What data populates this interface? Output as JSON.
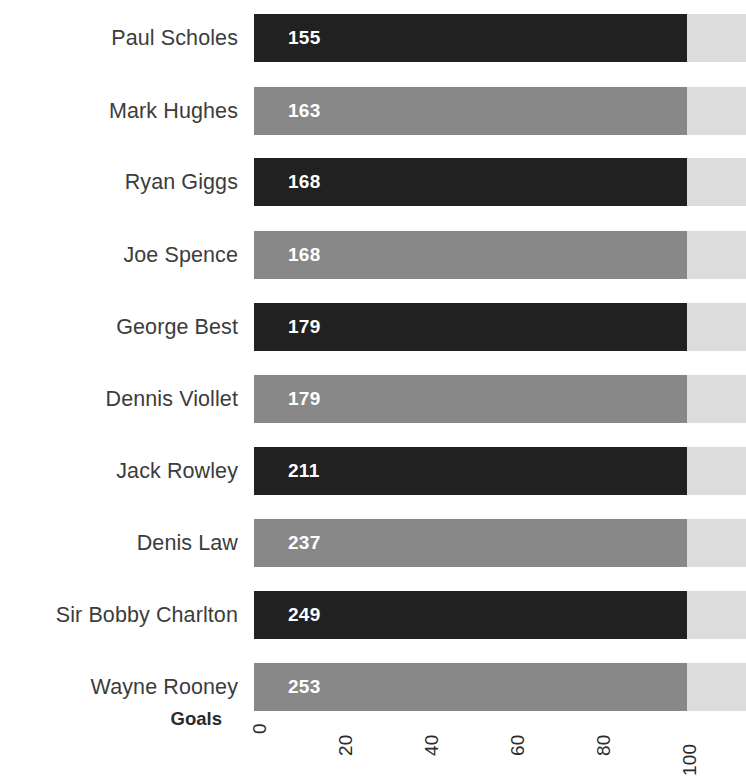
{
  "chart_data": {
    "type": "bar",
    "orientation": "horizontal",
    "title": "",
    "xlabel": "Goals",
    "ylabel": "",
    "xlim": [
      0,
      100
    ],
    "xticks": [
      "0",
      "20",
      "40",
      "60",
      "80",
      "100"
    ],
    "xtick_rotation": -90,
    "grid": false,
    "legend": false,
    "categories": [
      "Paul Scholes",
      "Mark Hughes",
      "Ryan Giggs",
      "Joe Spence",
      "George Best",
      "Dennis Viollet",
      "Jack Rowley",
      "Denis Law",
      "Sir Bobby Charlton",
      "Wayne Rooney"
    ],
    "values": [
      155,
      163,
      168,
      168,
      179,
      179,
      211,
      237,
      249,
      253
    ],
    "bar_labels": [
      "155",
      "163",
      "168",
      "168",
      "179",
      "179",
      "211",
      "237",
      "249",
      "253"
    ],
    "bar_lengths_pct": [
      100,
      100,
      100,
      100,
      100,
      100,
      100,
      100,
      100,
      100
    ],
    "series_name": "Goals"
  },
  "colors": {
    "bar_dark": "#212121",
    "bar_light": "#888888",
    "bar_track": "#dcdcdc",
    "label_text": "#3c3c3c",
    "axis_text": "#2b2b2b",
    "value_text": "#ffffff",
    "background": "#ffffff"
  },
  "axis": {
    "title": "Goals",
    "ticks": [
      {
        "label": "0",
        "x": 258
      },
      {
        "label": "20",
        "x": 344
      },
      {
        "label": "40",
        "x": 430
      },
      {
        "label": "60",
        "x": 516
      },
      {
        "label": "80",
        "x": 602
      },
      {
        "label": "100",
        "x": 688
      }
    ]
  },
  "rows": [
    {
      "label": "Paul Scholes",
      "value": "155",
      "tone": "dark",
      "top": 14,
      "fill": 433
    },
    {
      "label": "Mark Hughes",
      "value": "163",
      "tone": "light",
      "top": 87,
      "fill": 433
    },
    {
      "label": "Ryan Giggs",
      "value": "168",
      "tone": "dark",
      "top": 158,
      "fill": 433
    },
    {
      "label": "Joe Spence",
      "value": "168",
      "tone": "light",
      "top": 231,
      "fill": 433
    },
    {
      "label": "George Best",
      "value": "179",
      "tone": "dark",
      "top": 303,
      "fill": 433
    },
    {
      "label": "Dennis Viollet",
      "value": "179",
      "tone": "light",
      "top": 375,
      "fill": 433
    },
    {
      "label": "Jack Rowley",
      "value": "211",
      "tone": "dark",
      "top": 447,
      "fill": 433
    },
    {
      "label": "Denis Law",
      "value": "237",
      "tone": "light",
      "top": 519,
      "fill": 433
    },
    {
      "label": "Sir Bobby Charlton",
      "value": "249",
      "tone": "dark",
      "top": 591,
      "fill": 433
    },
    {
      "label": "Wayne Rooney",
      "value": "253",
      "tone": "light",
      "top": 663,
      "fill": 433
    }
  ]
}
